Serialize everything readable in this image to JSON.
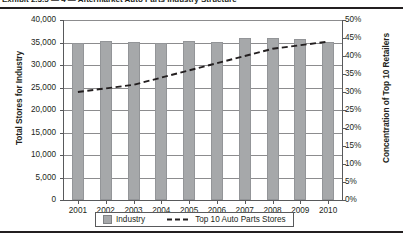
{
  "caption": {
    "text": "Exhibit 2.3.5 — 4 — Aftermarket Auto Parts Industry Structure"
  },
  "chart_data": {
    "type": "bar",
    "title": "",
    "categories": [
      "2001",
      "2002",
      "2003",
      "2004",
      "2005",
      "2006",
      "2007",
      "2008",
      "2009",
      "2010"
    ],
    "series": [
      {
        "name": "Industry",
        "type": "bar",
        "axis": "left",
        "values": [
          34800,
          35400,
          35100,
          34800,
          35400,
          35100,
          36000,
          36000,
          35700,
          35200
        ]
      },
      {
        "name": "Top 10 Auto Parts Stores",
        "type": "line",
        "axis": "right",
        "values": [
          30,
          31,
          32,
          34,
          36,
          38,
          40,
          42,
          43,
          44
        ]
      }
    ],
    "xlabel": "",
    "ylabel": "Total Stores for Industry",
    "y2label": "Concentration of Top 10 Retailers",
    "ylim": [
      0,
      40000
    ],
    "y2lim": [
      0,
      50
    ],
    "yticks": [
      "0",
      "5,000",
      "10,000",
      "15,000",
      "20,000",
      "25,000",
      "30,000",
      "35,000",
      "40,000"
    ],
    "ytick_values": [
      0,
      5000,
      10000,
      15000,
      20000,
      25000,
      30000,
      35000,
      40000
    ],
    "y2ticks": [
      "0%",
      "5%",
      "10%",
      "15%",
      "20%",
      "25%",
      "30%",
      "35%",
      "40%",
      "45%",
      "50%"
    ],
    "y2tick_values": [
      0,
      5,
      10,
      15,
      20,
      25,
      30,
      35,
      40,
      45,
      50
    ],
    "grid": true,
    "legend_position": "bottom",
    "colors": {
      "bar": "#a6a8aa",
      "line": "#231f20",
      "axis": "#58595b",
      "grid": "#8c8c8e",
      "text": "#231f20"
    }
  },
  "legend": {
    "bar_label": "Industry",
    "line_label": "Top 10 Auto Parts Stores"
  }
}
